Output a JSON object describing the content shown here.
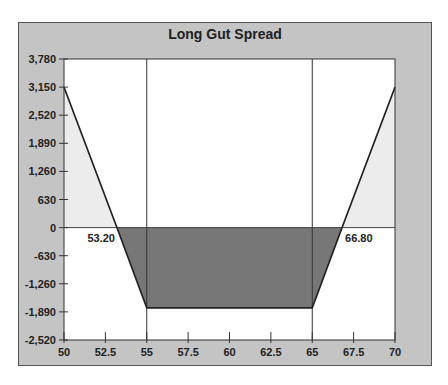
{
  "chart_data": {
    "type": "area",
    "title": "Long Gut Spread",
    "xlabel": "",
    "ylabel": "",
    "xlim": [
      50,
      70
    ],
    "ylim": [
      -2520,
      3780
    ],
    "x_ticks": [
      "50",
      "52.5",
      "55",
      "57.5",
      "60",
      "62.5",
      "65",
      "67.5",
      "70"
    ],
    "y_ticks": [
      "3,780",
      "3,150",
      "2,520",
      "1,890",
      "1,260",
      "630",
      "0",
      "-630",
      "-1,260",
      "-1,890",
      "-2,520"
    ],
    "grid": false,
    "series": [
      {
        "name": "Payoff",
        "x": [
          50,
          53.2,
          55,
          65,
          66.8,
          70
        ],
        "y": [
          3150,
          0,
          -1800,
          -1800,
          0,
          3150
        ]
      }
    ],
    "vertical_lines": [
      55,
      65
    ],
    "annotations": [
      {
        "text": "53.20",
        "x": 53.2,
        "y": 0
      },
      {
        "text": "66.80",
        "x": 66.8,
        "y": 0
      }
    ],
    "colors": {
      "frame_bg": "#c4c4c4",
      "plot_bg": "#ffffff",
      "profit_fill": "#ececec",
      "loss_fill": "#777777",
      "line": "#222222"
    }
  }
}
